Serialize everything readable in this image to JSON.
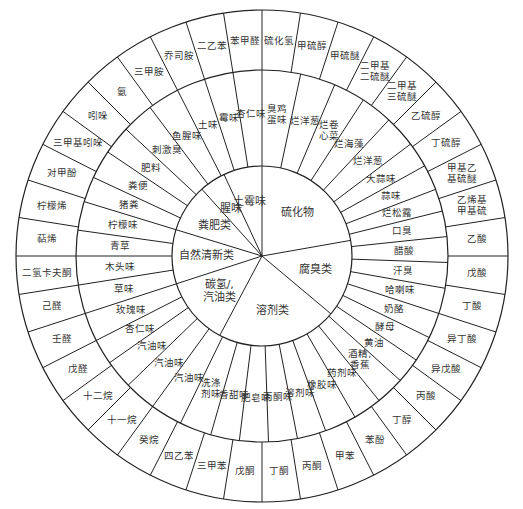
{
  "diagram": {
    "center": [
      262,
      256
    ],
    "radii": {
      "outer": 246,
      "middle": 186,
      "inner": 90
    },
    "line_color": "#222222",
    "text_color": "#333333",
    "categories": [
      {
        "label": "硫化物",
        "start": -90,
        "end": -10
      },
      {
        "label": "腐臭类",
        "start": -10,
        "end": 40
      },
      {
        "label": "溶剂类",
        "start": 40,
        "end": 118
      },
      {
        "label": "碳氢/汽油类",
        "start": 118,
        "end": 162
      },
      {
        "label": "自然清新类",
        "start": 162,
        "end": 197
      },
      {
        "label": "粪肥类",
        "start": 197,
        "end": 228
      },
      {
        "label": "腥味",
        "start": 228,
        "end": 245
      },
      {
        "label": "土霉味",
        "start": 245,
        "end": 270
      }
    ],
    "middle_ring": [
      {
        "label": "臭鸡蛋味",
        "start": -90,
        "end": -78
      },
      {
        "label": "烂洋葱",
        "start": -78,
        "end": -67
      },
      {
        "label": "烂卷心菜",
        "start": -67,
        "end": -57
      },
      {
        "label": "烂海藻",
        "start": -57,
        "end": -47
      },
      {
        "label": "烂洋葱",
        "start": -47,
        "end": -37
      },
      {
        "label": "大蒜味",
        "start": -37,
        "end": -29
      },
      {
        "label": "蒜味",
        "start": -29,
        "end": -21
      },
      {
        "label": "烂松露",
        "start": -21,
        "end": -14
      },
      {
        "label": "口臭",
        "start": -14,
        "end": -6
      },
      {
        "label": "醋酸",
        "start": -6,
        "end": 2
      },
      {
        "label": "汗臭",
        "start": 2,
        "end": 10
      },
      {
        "label": "哈喇味",
        "start": 10,
        "end": 18
      },
      {
        "label": "奶酪",
        "start": 18,
        "end": 26
      },
      {
        "label": "酵母",
        "start": 26,
        "end": 34
      },
      {
        "label": "黄油",
        "start": 34,
        "end": 42
      },
      {
        "label": "酒精,香蕉",
        "start": 42,
        "end": 51
      },
      {
        "label": "药剂味",
        "start": 51,
        "end": 60
      },
      {
        "label": "橡胶味",
        "start": 60,
        "end": 70
      },
      {
        "label": "溶剂味",
        "start": 70,
        "end": 79
      },
      {
        "label": "丙酮味",
        "start": 79,
        "end": 88
      },
      {
        "label": "肥皂味",
        "start": 88,
        "end": 97
      },
      {
        "label": "香甜味",
        "start": 97,
        "end": 106
      },
      {
        "label": "洗涤剂味",
        "start": 106,
        "end": 116
      },
      {
        "label": "汽油味",
        "start": 116,
        "end": 126
      },
      {
        "label": "汽油味",
        "start": 126,
        "end": 136
      },
      {
        "label": "汽油味",
        "start": 136,
        "end": 145
      },
      {
        "label": "杏仁味",
        "start": 145,
        "end": 153
      },
      {
        "label": "玫瑰味",
        "start": 153,
        "end": 162
      },
      {
        "label": "草味",
        "start": 162,
        "end": 171
      },
      {
        "label": "木头味",
        "start": 171,
        "end": 180
      },
      {
        "label": "青草",
        "start": 180,
        "end": 188
      },
      {
        "label": "柠檬味",
        "start": 188,
        "end": 197
      },
      {
        "label": "猪粪",
        "start": 197,
        "end": 205
      },
      {
        "label": "粪便",
        "start": 205,
        "end": 214
      },
      {
        "label": "肥料",
        "start": 214,
        "end": 223
      },
      {
        "label": "刺激臭",
        "start": 223,
        "end": 233
      },
      {
        "label": "鱼腥味",
        "start": 233,
        "end": 243
      },
      {
        "label": "土味",
        "start": 243,
        "end": 252
      },
      {
        "label": "霉味",
        "start": 252,
        "end": 261
      },
      {
        "label": "杏仁味",
        "start": 261,
        "end": 270
      }
    ],
    "outer_ring": [
      {
        "label": "硫化氢",
        "start": -90,
        "end": -77
      },
      {
        "label": "甲硫醇",
        "start": -77,
        "end": -66
      },
      {
        "label": "甲硫醚",
        "start": -66,
        "end": -55
      },
      {
        "label": "二甲基二硫醚",
        "start": -55,
        "end": -44
      },
      {
        "label": "二甲基三硫醚",
        "start": -44,
        "end": -34
      },
      {
        "label": "乙硫醇",
        "start": -34,
        "end": -25
      },
      {
        "label": "丁硫醇",
        "start": -25,
        "end": -16
      },
      {
        "label": "甲基乙基硫醚",
        "start": -16,
        "end": -8
      },
      {
        "label": "乙烯基甲基硫",
        "start": -8,
        "end": 0
      },
      {
        "label": "乙酸",
        "start": -8,
        "end": 0,
        "skip": true
      },
      {
        "label": "戊酸",
        "start": 0,
        "end": 9
      },
      {
        "label": "丁酸",
        "start": 9,
        "end": 19
      },
      {
        "label": "异丁酸",
        "start": 19,
        "end": 28
      },
      {
        "label": "异戊酸",
        "start": 28,
        "end": 38
      },
      {
        "label": "丙酸",
        "start": 38,
        "end": 48
      },
      {
        "label": "丁醇",
        "start": 48,
        "end": 57
      },
      {
        "label": "苯酚",
        "start": 57,
        "end": 67
      },
      {
        "label": "甲苯",
        "start": 67,
        "end": 77
      },
      {
        "label": "丙酮",
        "start": 77,
        "end": 87
      },
      {
        "label": "丁酮",
        "start": 87,
        "end": 97
      },
      {
        "label": "戊酮",
        "start": 97,
        "end": 107
      },
      {
        "label": "三甲苯",
        "start": 107,
        "end": 118
      },
      {
        "label": "四乙苯",
        "start": 118,
        "end": 129
      },
      {
        "label": "癸烷",
        "start": 129,
        "end": 140
      },
      {
        "label": "十一烷",
        "start": 140,
        "end": 151
      },
      {
        "label": "十二烷",
        "start": 151,
        "end": 162
      },
      {
        "label": "戊醛",
        "start": 162,
        "end": 171
      },
      {
        "label": "壬醛",
        "start": 171,
        "end": 180
      },
      {
        "label": "己醛",
        "start": 180,
        "end": 189
      },
      {
        "label": "二氢卡夫酮",
        "start": 189,
        "end": 198
      },
      {
        "label": "萜烯",
        "start": 198,
        "end": 207
      },
      {
        "label": "柠檬烯",
        "start": 207,
        "end": 216
      },
      {
        "label": "对甲酚",
        "start": 216,
        "end": 225
      },
      {
        "label": "三甲基吲哚",
        "start": 225,
        "end": 234
      },
      {
        "label": "吲哚",
        "start": 234,
        "end": 243
      },
      {
        "label": "氨",
        "start": 243,
        "end": 252
      },
      {
        "label": "三甲胺",
        "start": 252,
        "end": 260
      },
      {
        "label": "乔司胺",
        "start": 260,
        "end": 267
      },
      {
        "label": "二乙苯",
        "start": 267,
        "end": 276
      },
      {
        "label": "苯甲醛",
        "start": 276,
        "end": 283
      }
    ]
  }
}
